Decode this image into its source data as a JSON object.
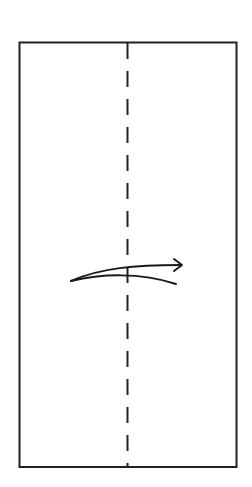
{
  "diagram": {
    "type": "origami-fold-instruction",
    "paper": {
      "x": 19,
      "y": 42,
      "width": 217,
      "height": 425,
      "stroke": "#222222"
    },
    "fold_line": {
      "style": "dashed",
      "x": 127,
      "y1": 42,
      "y2": 467,
      "dash": 17,
      "gap": 12
    },
    "fold_arrow": {
      "direction": "right",
      "start": [
        71,
        281
      ],
      "end": [
        182,
        265
      ]
    },
    "colors": {
      "stroke": "#222222",
      "background": "#ffffff"
    }
  }
}
